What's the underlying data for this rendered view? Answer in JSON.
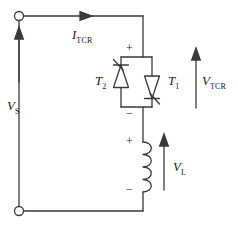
{
  "figure": {
    "type": "circuit-schematic",
    "stroke_color": "#3a3a3a",
    "text_color": "#1a1a1a",
    "background": "#ffffff"
  },
  "labels": {
    "source_voltage": {
      "symbol": "V",
      "subscript": "S",
      "x": 8,
      "y": 100
    },
    "tcr_current": {
      "symbol": "I",
      "subscript": "TCR",
      "x": 73,
      "y": 29
    },
    "thyristor_left": {
      "symbol": "T",
      "subscript": "2",
      "x": 97,
      "y": 76
    },
    "thyristor_right": {
      "symbol": "T",
      "subscript": "1",
      "x": 170,
      "y": 76
    },
    "tcr_voltage": {
      "symbol": "V",
      "subscript": "TCR",
      "x": 203,
      "y": 76
    },
    "inductor_voltage": {
      "symbol": "V",
      "subscript": "L",
      "x": 174,
      "y": 162
    }
  },
  "polarity_marks": {
    "tcr_plus": {
      "text": "+",
      "x": 128,
      "y": 45
    },
    "tcr_minus": {
      "text": "−",
      "x": 128,
      "y": 110
    },
    "inductor_plus": {
      "text": "+",
      "x": 128,
      "y": 137
    },
    "inductor_minus": {
      "text": "−",
      "x": 128,
      "y": 185
    }
  },
  "terminals": {
    "top": {
      "x": 19,
      "y": 16,
      "radius": 4.5
    },
    "bottom": {
      "x": 19,
      "y": 211,
      "radius": 4.5
    }
  },
  "arrows": {
    "current_tcr": {
      "direction": "right",
      "x1": 40,
      "y1": 16,
      "x2": 90,
      "y2": 16
    },
    "voltage_source": {
      "direction": "up",
      "x1": 19,
      "y1": 82,
      "x2": 19,
      "y2": 30
    },
    "voltage_tcr": {
      "direction": "up",
      "x1": 196,
      "y1": 108,
      "x2": 196,
      "y2": 50
    },
    "voltage_inductor": {
      "direction": "up",
      "x1": 164,
      "y1": 190,
      "x2": 164,
      "y2": 137
    }
  },
  "components": {
    "thyristor_t2": {
      "orientation": "cathode-up",
      "gate_side": "upper-left",
      "x": 121,
      "y_top": 57,
      "y_bottom": 107
    },
    "thyristor_t1": {
      "orientation": "cathode-down",
      "gate_side": "lower-right",
      "x": 152,
      "y_top": 57,
      "y_bottom": 107
    },
    "inductor": {
      "x": 143,
      "y_top": 142,
      "y_bottom": 192,
      "coils": 4,
      "bulge_side": "right"
    }
  }
}
